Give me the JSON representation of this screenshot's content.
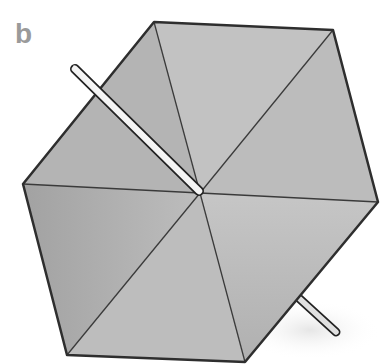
{
  "figure": {
    "panel_label": "b",
    "canopy": {
      "shape": "hexagon",
      "vertices": [
        [
          154,
          22
        ],
        [
          333,
          30
        ],
        [
          378,
          202
        ],
        [
          245,
          362
        ],
        [
          67,
          355
        ],
        [
          23,
          184
        ]
      ],
      "center": [
        200,
        193
      ],
      "fill_light": "#c4c4c4",
      "fill_dark": "#9a9a9a",
      "outline": "#333333"
    },
    "shaft": {
      "top": [
        74,
        68
      ],
      "bottom_tip": [
        338,
        334
      ],
      "fill": "#e2e2e2"
    }
  }
}
